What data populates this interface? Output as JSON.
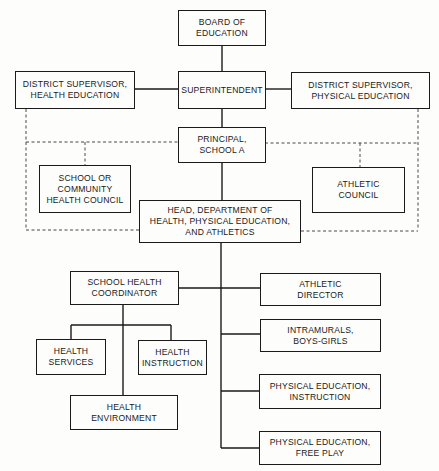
{
  "diagram": {
    "type": "organizational-chart",
    "nodes": {
      "board": "BOARD OF\nEDUCATION",
      "superintendent": "SUPERINTENDENT",
      "supervisor_health": "DISTRICT SUPERVISOR,\nHEALTH EDUCATION",
      "supervisor_pe": "DISTRICT SUPERVISOR,\nPHYSICAL EDUCATION",
      "principal": "PRINCIPAL,\nSCHOOL A",
      "health_council": "SCHOOL OR\nCOMMUNITY\nHEALTH COUNCIL",
      "athletic_council": "ATHLETIC\nCOUNCIL",
      "department_head": "HEAD, DEPARTMENT OF\nHEALTH, PHYSICAL EDUCATION,\nAND ATHLETICS",
      "health_coordinator": "SCHOOL HEALTH\nCOORDINATOR",
      "health_services": "HEALTH\nSERVICES",
      "health_instruction": "HEALTH\nINSTRUCTION",
      "health_environment": "HEALTH\nENVIRONMENT",
      "athletic_director": "ATHLETIC\nDIRECTOR",
      "intramurals": "INTRAMURALS,\nBOYS-GIRLS",
      "pe_instruction": "PHYSICAL EDUCATION,\nINSTRUCTION",
      "pe_free_play": "PHYSICAL EDUCATION,\nFREE PLAY"
    },
    "edges": {
      "solid": [
        [
          "board",
          "superintendent"
        ],
        [
          "superintendent",
          "supervisor_health"
        ],
        [
          "superintendent",
          "supervisor_pe"
        ],
        [
          "superintendent",
          "principal"
        ],
        [
          "principal",
          "department_head"
        ],
        [
          "department_head",
          "health_coordinator"
        ],
        [
          "department_head",
          "athletic_director"
        ],
        [
          "department_head",
          "intramurals"
        ],
        [
          "department_head",
          "pe_instruction"
        ],
        [
          "department_head",
          "pe_free_play"
        ],
        [
          "health_coordinator",
          "health_services"
        ],
        [
          "health_coordinator",
          "health_instruction"
        ],
        [
          "health_coordinator",
          "health_environment"
        ]
      ],
      "dashed": [
        [
          "supervisor_health",
          "department_head"
        ],
        [
          "supervisor_pe",
          "department_head"
        ],
        [
          "principal",
          "health_council"
        ],
        [
          "principal",
          "athletic_council"
        ]
      ]
    },
    "colors": {
      "line": "#1a1a1a",
      "background": "#fdfdfc"
    }
  }
}
